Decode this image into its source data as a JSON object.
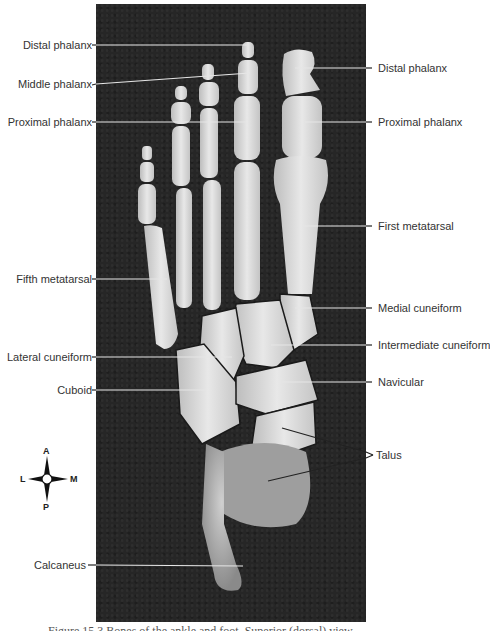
{
  "figure": {
    "caption": "Figure 15.3 Bones of the ankle and foot. Superior (dorsal) view."
  },
  "labels_left": [
    {
      "id": "distal-phalanx-left",
      "text": "Distal phalanx"
    },
    {
      "id": "middle-phalanx",
      "text": "Middle phalanx"
    },
    {
      "id": "proximal-phalanx-left",
      "text": "Proximal phalanx"
    },
    {
      "id": "fifth-metatarsal",
      "text": "Fifth metatarsal"
    },
    {
      "id": "lateral-cuneiform",
      "text": "Lateral cuneiform"
    },
    {
      "id": "cuboid",
      "text": "Cuboid"
    },
    {
      "id": "calcaneus",
      "text": "Calcaneus"
    }
  ],
  "labels_right": [
    {
      "id": "distal-phalanx-right",
      "text": "Distal phalanx"
    },
    {
      "id": "proximal-phalanx-right",
      "text": "Proximal phalanx"
    },
    {
      "id": "first-metatarsal",
      "text": "First metatarsal"
    },
    {
      "id": "medial-cuneiform",
      "text": "Medial cuneiform"
    },
    {
      "id": "intermediate-cuneiform",
      "text": "Intermediate cuneiform"
    },
    {
      "id": "navicular",
      "text": "Navicular"
    },
    {
      "id": "talus",
      "text": "Talus"
    }
  ],
  "compass": {
    "top": "A",
    "bottom": "P",
    "left": "L",
    "right": "M"
  },
  "colors": {
    "background": "#ffffff",
    "photo_bg": "#262626",
    "bone": "#d9d9d9",
    "leader_on_dark": "#e6e6e6",
    "leader_on_light": "#222222",
    "label_text": "#333333"
  }
}
